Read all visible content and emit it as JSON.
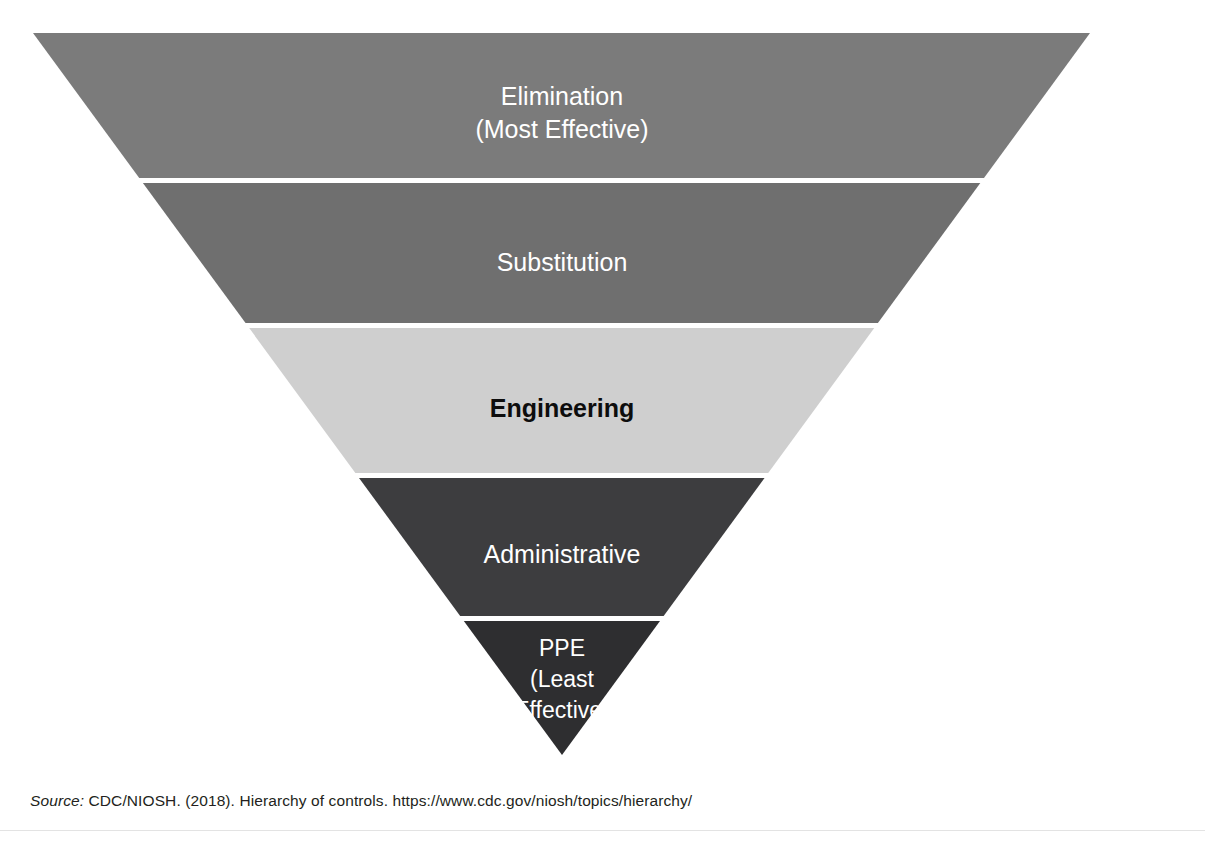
{
  "page": {
    "top_cut_text": "",
    "background_color": "#ffffff"
  },
  "figure": {
    "name": "hierarchy-of-controls-inverted-pyramid",
    "apex_left_x": 33,
    "apex_right_x": 1090,
    "top_y": 33,
    "bottom_tip_x": 562,
    "bottom_tip_y": 755,
    "divider_color": "#ffffff",
    "divider_thickness": 5
  },
  "chart_data": {
    "type": "pyramid",
    "title": "Hierarchy of Controls",
    "orientation": "inverted",
    "categories": [
      "Elimination (Most Effective)",
      "Substitution",
      "Engineering",
      "Administrative",
      "PPE (Least Effective)"
    ],
    "values": [
      5,
      4,
      3,
      2,
      1
    ],
    "ylabel": "Effectiveness",
    "xlabel": "",
    "legend": "none",
    "grid": false,
    "levels": [
      {
        "rank": 1,
        "label_lines": [
          "Elimination",
          "(Most Effective)"
        ],
        "fill": "#7b7b7b",
        "text_color": "#ffffff",
        "bold": false,
        "top_y": 33,
        "bottom_y": 178,
        "font_size": 25
      },
      {
        "rank": 2,
        "label_lines": [
          "Substitution"
        ],
        "fill": "#6f6f6f",
        "text_color": "#ffffff",
        "bold": false,
        "top_y": 183,
        "bottom_y": 323,
        "font_size": 25
      },
      {
        "rank": 3,
        "label_lines": [
          "Engineering"
        ],
        "fill": "#cfcfcf",
        "text_color": "#0d0d0d",
        "bold": true,
        "top_y": 328,
        "bottom_y": 473,
        "font_size": 25
      },
      {
        "rank": 4,
        "label_lines": [
          "Administrative"
        ],
        "fill": "#3d3d3f",
        "text_color": "#ffffff",
        "bold": false,
        "top_y": 478,
        "bottom_y": 616,
        "font_size": 25
      },
      {
        "rank": 5,
        "label_lines": [
          "PPE",
          "(Least",
          "Effective)"
        ],
        "fill": "#2e2e30",
        "text_color": "#ffffff",
        "bold": false,
        "top_y": 621,
        "bottom_y": 755,
        "font_size": 23
      }
    ]
  },
  "source": {
    "keyword": "Source:",
    "text": " CDC/NIOSH. (2018). Hierarchy of controls. https://www.cdc.gov/niosh/topics/hierarchy/"
  }
}
